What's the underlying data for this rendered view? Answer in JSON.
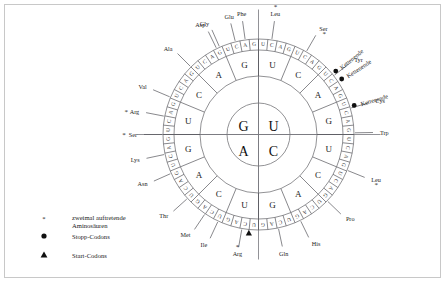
{
  "figure": {
    "type": "genetic-code-wheel",
    "language": "de",
    "center_bases": [
      {
        "label": "G",
        "pos": "top-left"
      },
      {
        "label": "U",
        "pos": "top-right"
      },
      {
        "label": "A",
        "pos": "bottom-left"
      },
      {
        "label": "C",
        "pos": "bottom-right"
      }
    ],
    "ring2_bases": [
      "U",
      "C",
      "A",
      "G",
      "U",
      "C",
      "A",
      "G",
      "U",
      "C",
      "A",
      "G",
      "U",
      "C",
      "A",
      "G"
    ],
    "ring3_bases": [
      "U",
      "C",
      "A",
      "G"
    ],
    "ring3_sequence_clockwise_from_top": [
      "U",
      "C",
      "A",
      "G",
      "U",
      "C",
      "A",
      "G",
      "U",
      "C",
      "A",
      "G",
      "U",
      "C",
      "A",
      "G",
      "U",
      "C",
      "A",
      "G",
      "U",
      "C",
      "A",
      "G",
      "U",
      "C",
      "A",
      "G",
      "U",
      "C",
      "A",
      "G",
      "U",
      "C",
      "A",
      "G",
      "U",
      "C",
      "A",
      "G",
      "U",
      "C",
      "A",
      "G",
      "U",
      "C",
      "A",
      "G",
      "U",
      "C",
      "A",
      "G",
      "U",
      "C",
      "A",
      "G",
      "U",
      "C",
      "A",
      "G",
      "U",
      "C",
      "A",
      "G"
    ],
    "amino_acids": [
      {
        "name": "Phe",
        "star": false,
        "angle": -8
      },
      {
        "name": "Leu",
        "star": true,
        "angle": 8
      },
      {
        "name": "Ser",
        "star": true,
        "angle": 30
      },
      {
        "name": "Tyr",
        "star": false,
        "angle": 52
      },
      {
        "name": "Cys",
        "star": false,
        "angle": 74
      },
      {
        "name": "Trp",
        "star": false,
        "angle": 89
      },
      {
        "name": "Leu",
        "star": true,
        "angle": 112
      },
      {
        "name": "Pro",
        "star": false,
        "angle": 134
      },
      {
        "name": "His",
        "star": false,
        "angle": 154
      },
      {
        "name": "Gln",
        "star": false,
        "angle": 168
      },
      {
        "name": "Arg",
        "star": true,
        "angle": 190
      },
      {
        "name": "Ile",
        "star": false,
        "angle": 205
      },
      {
        "name": "Met",
        "star": false,
        "angle": 214
      },
      {
        "name": "Thr",
        "star": false,
        "angle": 228
      },
      {
        "name": "Asn",
        "star": false,
        "angle": 246
      },
      {
        "name": "Lys",
        "star": false,
        "angle": 258
      },
      {
        "name": "Ser",
        "star": true,
        "angle": 270
      },
      {
        "name": "Arg",
        "star": true,
        "angle": 281
      },
      {
        "name": "Val",
        "star": false,
        "angle": 293
      },
      {
        "name": "Ala",
        "star": false,
        "angle": 315
      },
      {
        "name": "Asp",
        "star": false,
        "angle": 334
      },
      {
        "name": "Glu",
        "star": false,
        "angle": 346
      },
      {
        "name": "Gly",
        "star": false,
        "angle": -24
      }
    ],
    "stop_labels": [
      {
        "text": "Kettenende",
        "id": "stop-1"
      },
      {
        "text": "Kettenende",
        "id": "stop-2"
      },
      {
        "text": "Kettenende",
        "id": "stop-3"
      }
    ],
    "start_marker": {
      "symbol": "triangle",
      "near": "Met"
    }
  },
  "legend": {
    "items": [
      {
        "symbol": "asterisk",
        "line1": "zweimal auftretende",
        "line2": "Aminosäuren"
      },
      {
        "symbol": "circle",
        "line1": "Stopp-Codons",
        "line2": ""
      },
      {
        "symbol": "triangle",
        "line1": "Start-Codons",
        "line2": ""
      }
    ]
  },
  "colors": {
    "background": "#ffffff",
    "border": "#c8c8c8",
    "line": "#6e6e72",
    "text": "#1a1a1a",
    "marker": "#101010"
  }
}
